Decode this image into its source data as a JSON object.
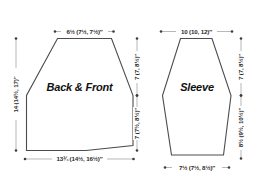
{
  "diagram": {
    "background_color": "#ffffff",
    "outline_color": "#4c4c4c",
    "dimension_line_color": "#9a9a9a",
    "text_color": "#2b2b2b",
    "pieces": [
      {
        "id": "back-and-front",
        "label": "Back & Front",
        "dimensions": {
          "top_width": "6½ (7½, 7½)″",
          "bottom_width": "13¾ (14½, 16½)″",
          "left_height": "14 (14½, 17)″",
          "right_upper": "7 (7, 8½)″",
          "right_lower": "7 (7½, 8½)″"
        }
      },
      {
        "id": "sleeve",
        "label": "Sleeve",
        "dimensions": {
          "top_width": "10 (10, 12)″",
          "bottom_width": "7½ (7½, 8½)″",
          "right_upper": "7 (7, 8½)″",
          "right_lower": "8½ (9½, 10½)″"
        }
      }
    ]
  }
}
